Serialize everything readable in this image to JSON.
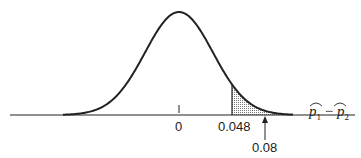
{
  "chart_data": {
    "type": "area",
    "title": "",
    "xlabel": "p̂1 − p̂2",
    "ylabel": "",
    "center": 0,
    "tick_labels": [
      "0",
      "0.048"
    ],
    "critical_value": 0.048,
    "observed_value": 0.08,
    "shaded_region": {
      "from": 0.048,
      "to": "right tail"
    },
    "annotations": [
      {
        "text": "0.08",
        "type": "arrow",
        "points_to": 0.08
      }
    ],
    "grid": false,
    "legend": "none"
  },
  "labels": {
    "zero": "0",
    "critical": "0.048",
    "observed": "0.08",
    "axis_p1": "p",
    "axis_sub1": "1",
    "axis_minus": "−",
    "axis_p2": "p",
    "axis_sub2": "2"
  }
}
